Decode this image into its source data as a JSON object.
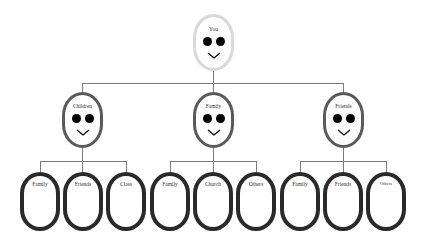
{
  "diagram": {
    "type": "tree",
    "root": {
      "label": "You"
    },
    "level1": [
      {
        "label": "Children",
        "children": [
          "Family",
          "Friends",
          "Class"
        ]
      },
      {
        "label": "Family",
        "children": [
          "Family",
          "Church",
          "Others"
        ]
      },
      {
        "label": "Friends",
        "children": [
          "Family",
          "Friends",
          "Others"
        ]
      }
    ]
  },
  "colors": {
    "root_border": "#d9d9d9",
    "mid_border": "#5a5a5a",
    "leaf_border": "#2a2a2a",
    "connector": "#7a7a7a"
  }
}
